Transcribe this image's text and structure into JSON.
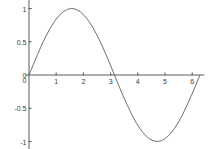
{
  "chart_data": {
    "type": "line",
    "title": "",
    "xlabel": "",
    "ylabel": "",
    "xlim": [
      -0.12,
      6.45
    ],
    "ylim": [
      -1.18,
      1.18
    ],
    "grid": false,
    "legend": null,
    "xticks": [
      0,
      1,
      2,
      3,
      4,
      5,
      6
    ],
    "xtick_labels": [
      "0",
      "1",
      "2",
      "3",
      "4",
      "5",
      "6"
    ],
    "yticks": [
      1,
      0.5,
      0,
      -0.5,
      -1
    ],
    "ytick_labels": [
      "1",
      "0.5",
      "0",
      "-0.5",
      "-1"
    ],
    "series": [
      {
        "name": "sin(x)",
        "color": "#555555",
        "x": [
          0,
          0.1571,
          0.3142,
          0.4712,
          0.6283,
          0.7854,
          0.9425,
          1.0996,
          1.2566,
          1.4137,
          1.5708,
          1.7279,
          1.885,
          2.042,
          2.1991,
          2.3562,
          2.5133,
          2.6704,
          2.8274,
          2.9845,
          3.1416,
          3.2987,
          3.4558,
          3.6128,
          3.7699,
          3.927,
          4.0841,
          4.2412,
          4.3982,
          4.5553,
          4.7124,
          4.8695,
          5.0265,
          5.1836,
          5.3407,
          5.4978,
          5.6549,
          5.8119,
          5.969,
          6.1261,
          6.2832
        ],
        "y": [
          0,
          0.1564,
          0.309,
          0.454,
          0.5878,
          0.7071,
          0.809,
          0.891,
          0.9511,
          0.9877,
          1,
          0.9877,
          0.9511,
          0.891,
          0.809,
          0.7071,
          0.5878,
          0.454,
          0.309,
          0.1564,
          0,
          -0.1564,
          -0.309,
          -0.454,
          -0.5878,
          -0.7071,
          -0.809,
          -0.891,
          -0.9511,
          -0.9877,
          -1,
          -0.9877,
          -0.9511,
          -0.891,
          -0.809,
          -0.7071,
          -0.5878,
          -0.454,
          -0.309,
          -0.1564,
          0
        ]
      }
    ],
    "axis_color": "#4a4a4a",
    "background_color": "#ffffff"
  }
}
